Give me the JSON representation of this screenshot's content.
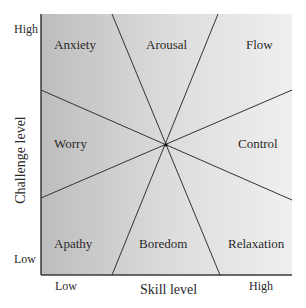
{
  "diagram": {
    "axes": {
      "x_title": "Skill level",
      "y_title": "Challenge level",
      "x_low": "Low",
      "x_high": "High",
      "y_low": "Low",
      "y_high": "High"
    },
    "regions": {
      "anxiety": "Anxiety",
      "arousal": "Arousal",
      "flow": "Flow",
      "worry": "Worry",
      "control": "Control",
      "apathy": "Apathy",
      "boredom": "Boredom",
      "relaxation": "Relaxation"
    },
    "colors": {
      "low_skill_shade": "#c4c4c4",
      "high_skill_shade": "#ececec",
      "line": "#333333",
      "axis": "#3a3a3a"
    }
  }
}
